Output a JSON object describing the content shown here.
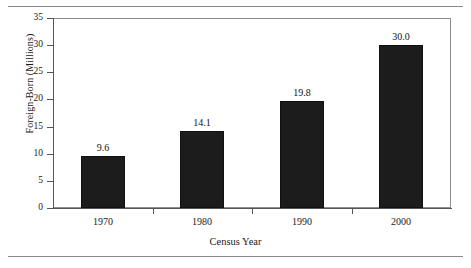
{
  "chart_data": {
    "type": "bar",
    "title": "",
    "subtitle": "",
    "xlabel": "Census Year",
    "ylabel": "Foreign-Born (Millions)",
    "categories": [
      "1970",
      "1980",
      "1990",
      "2000"
    ],
    "values": [
      9.6,
      14.1,
      19.8,
      30.0
    ],
    "value_labels": [
      "9.6",
      "14.1",
      "19.8",
      "30.0"
    ],
    "ylim": [
      0,
      35
    ],
    "ytick_labels": [
      "0",
      "5",
      "10",
      "15",
      "20",
      "25",
      "30",
      "35"
    ],
    "ytick_values": [
      0,
      5,
      10,
      15,
      20,
      25,
      30,
      35
    ],
    "grid": false,
    "legend": null,
    "bar_color": "#1c1c1c",
    "axis_color": "#555555",
    "frame_color": "#8c8c8c",
    "text_color": "#111111"
  },
  "figure": {
    "rule_color": "#8a8a8a"
  }
}
